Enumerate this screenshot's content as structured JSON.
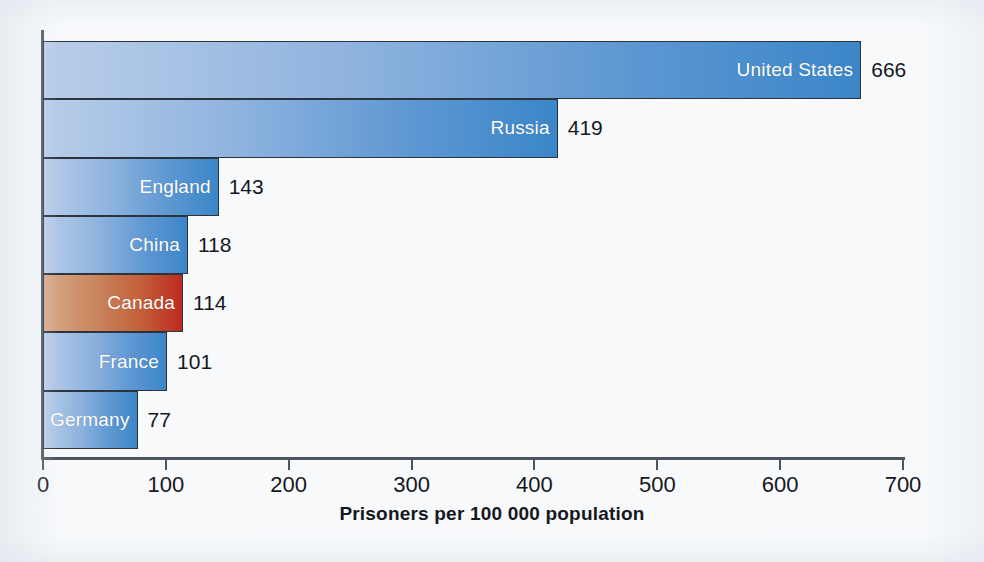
{
  "chart_data": {
    "type": "bar",
    "orientation": "horizontal",
    "title": "",
    "xlabel": "Prisoners per 100 000 population",
    "ylabel": "",
    "xlim": [
      0,
      700
    ],
    "xticks": [
      0,
      100,
      200,
      300,
      400,
      500,
      600,
      700
    ],
    "xtick_labels": [
      "0",
      "100",
      "200",
      "300",
      "400",
      "500",
      "600",
      "700"
    ],
    "grid": false,
    "legend": "none",
    "categories": [
      "United States",
      "Russia",
      "England",
      "China",
      "Canada",
      "France",
      "Germany"
    ],
    "values": [
      666,
      419,
      143,
      118,
      114,
      101,
      77
    ],
    "value_labels": [
      "666",
      "419",
      "143",
      "118",
      "114",
      "101",
      "77"
    ],
    "bars": [
      {
        "label": "United States",
        "value": 666,
        "value_label": "666",
        "highlight": false
      },
      {
        "label": "Russia",
        "value": 419,
        "value_label": "419",
        "highlight": false
      },
      {
        "label": "England",
        "value": 143,
        "value_label": "143",
        "highlight": false
      },
      {
        "label": "China",
        "value": 118,
        "value_label": "118",
        "highlight": false
      },
      {
        "label": "Canada",
        "value": 114,
        "value_label": "114",
        "highlight": true
      },
      {
        "label": "France",
        "value": 101,
        "value_label": "101",
        "highlight": false
      },
      {
        "label": "Germany",
        "value": 77,
        "value_label": "77",
        "highlight": false
      }
    ],
    "colors": {
      "bar_gradient_start": "#b9cde9",
      "bar_gradient_end": "#3b86c8",
      "highlight_gradient_start": "#d8a98c",
      "highlight_gradient_end": "#bc2a20",
      "bar_outline": "#2b333c",
      "axis": "#4a5560",
      "label_text": "#ffffff",
      "value_text": "#15181c",
      "background": "#f7f9fb"
    }
  }
}
